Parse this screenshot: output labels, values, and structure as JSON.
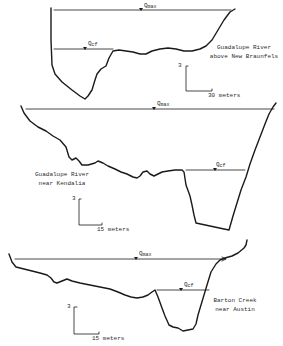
{
  "figure": {
    "panels": [
      {
        "id": "guadalupe-new-braunfels",
        "location_line1": "Guadalupe River",
        "location_line2": "above New Braunfels",
        "q_max_label": "Q",
        "q_max_sub": "max",
        "q_cf_label": "Q",
        "q_cf_sub": "cf",
        "scale_vertical": "3",
        "scale_horizontal": "30 meters"
      },
      {
        "id": "guadalupe-kendalia",
        "location_line1": "Guadalupe River",
        "location_line2": "near Kendalia",
        "q_max_label": "Q",
        "q_max_sub": "max",
        "q_cf_label": "Q",
        "q_cf_sub": "cf",
        "scale_vertical": "3",
        "scale_horizontal": "15 meters"
      },
      {
        "id": "barton-creek-austin",
        "location_line1": "Barton Creek",
        "location_line2": "near Austin",
        "q_max_label": "Q",
        "q_max_sub": "max",
        "q_cf_label": "Q",
        "q_cf_sub": "cf",
        "scale_vertical": "3",
        "scale_horizontal": "15 meters"
      }
    ],
    "colors": {
      "ink": "#1a1a1a",
      "background": "#ffffff"
    }
  }
}
